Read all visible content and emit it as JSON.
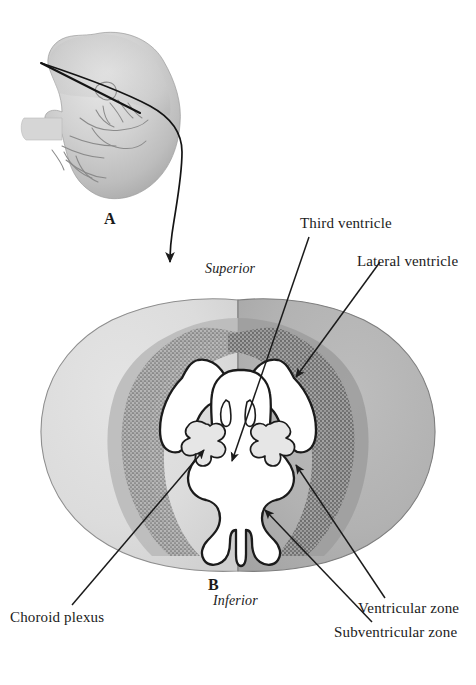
{
  "figure": {
    "type": "anatomical-illustration",
    "panels": [
      {
        "id": "A",
        "letter": "A",
        "description": "Lateral view of embryo head with plane-of-section line"
      },
      {
        "id": "B",
        "letter": "B",
        "description": "Coronal cross-section of the forebrain"
      }
    ]
  },
  "panel_a": {
    "letter": "A"
  },
  "panel_b": {
    "letter": "B",
    "orientation": {
      "superior": "Superior",
      "inferior": "Inferior"
    }
  },
  "labels": [
    {
      "id": "third-ventricle",
      "text": "Third ventricle"
    },
    {
      "id": "lateral-ventricle",
      "text": "Lateral ventricle"
    },
    {
      "id": "choroid-plexus",
      "text": "Choroid plexus"
    },
    {
      "id": "ventricular-zone",
      "text": "Ventricular zone"
    },
    {
      "id": "subventricular-zone",
      "text": "Subventricular zone"
    }
  ],
  "label_text": {
    "third_ventricle": "Third ventricle",
    "lateral_ventricle": "Lateral ventricle",
    "choroid_plexus": "Choroid plexus",
    "ventricular_zone": "Ventricular zone",
    "subventricular_zone": "Subventricular zone",
    "superior": "Superior",
    "inferior": "Inferior",
    "panel_a_letter": "A",
    "panel_b_letter": "B"
  },
  "colors": {
    "background": "#ffffff",
    "line": "#1b1b1b",
    "embryo_light": "#dcdcdc",
    "embryo_mid": "#bcbcbc",
    "embryo_dark": "#9a9a9a",
    "mantle_light": "#dedede",
    "mantle_dark": "#b2b2b2",
    "subventricular_band": "#a9a9a9",
    "ventricular_band": "#8f8f8f",
    "ventricle_lumen": "#ffffff",
    "choroid_fill": "#e4e4e4",
    "text": "#1b1b1b"
  }
}
